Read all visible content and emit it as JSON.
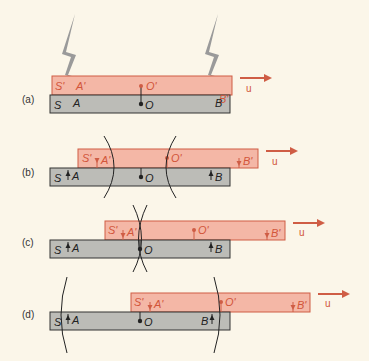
{
  "figure": {
    "colors": {
      "background": "#fbf6e9",
      "moving_frame_fill": "#f4b7a6",
      "moving_frame_stroke": "#cf5d45",
      "moving_frame_text": "#d2553a",
      "rest_frame_fill": "#bcbcb7",
      "rest_frame_stroke": "#333333",
      "lightning": "#9a9a9a",
      "wavefront": "#222222"
    },
    "velocity_label": "u",
    "panels": [
      {
        "id": "a",
        "label": "(a)",
        "rest_frame": {
          "name": "S",
          "points": [
            "A",
            "O",
            "B"
          ]
        },
        "moving_frame": {
          "name": "S'",
          "points": [
            "A'",
            "O'",
            "B'"
          ]
        },
        "description": "Lightning strikes at A/A' and B/B' simultaneously in S"
      },
      {
        "id": "b",
        "label": "(b)",
        "rest_frame": {
          "name": "S",
          "points": [
            "A",
            "O",
            "B"
          ]
        },
        "moving_frame": {
          "name": "S'",
          "points": [
            "A'",
            "O'",
            "B'"
          ]
        },
        "description": "Wavefronts expanding; front from B reaches O'"
      },
      {
        "id": "c",
        "label": "(c)",
        "rest_frame": {
          "name": "S",
          "points": [
            "A",
            "O",
            "B"
          ]
        },
        "moving_frame": {
          "name": "S'",
          "points": [
            "A'",
            "O'",
            "B'"
          ]
        },
        "description": "Both wavefronts reach O simultaneously"
      },
      {
        "id": "d",
        "label": "(d)",
        "rest_frame": {
          "name": "S",
          "points": [
            "A",
            "O",
            "B"
          ]
        },
        "moving_frame": {
          "name": "S'",
          "points": [
            "A'",
            "O'",
            "B'"
          ]
        },
        "description": "Front from A reaches O' later"
      }
    ]
  }
}
